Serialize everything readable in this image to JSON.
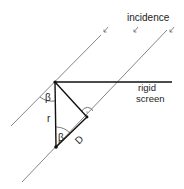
{
  "diagram": {
    "labels": {
      "incidence": "incidence",
      "screen_line1": "rigid",
      "screen_line2": "screen",
      "angle_top": "β",
      "angle_bottom": "β",
      "side_r": "r",
      "side_D": "D"
    },
    "colors": {
      "line": "#111111",
      "ray": "#555555",
      "text": "#222222",
      "background": "#ffffff"
    }
  }
}
